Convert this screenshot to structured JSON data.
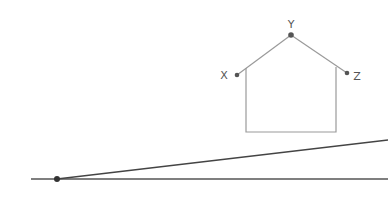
{
  "diagram": {
    "colors": {
      "house_stroke": "#9a9a9a",
      "line_stroke": "#555555",
      "point_fill": "#555555",
      "label_fill": "#555555",
      "background": "#ffffff"
    },
    "points": [
      {
        "id": "X",
        "label": "X",
        "x": 237,
        "y": 75
      },
      {
        "id": "Y",
        "label": "Y",
        "x": 291,
        "y": 35
      },
      {
        "id": "Z",
        "label": "Z",
        "x": 347,
        "y": 73
      },
      {
        "id": "origin",
        "label": "",
        "x": 57,
        "y": 179
      }
    ],
    "house": {
      "left_wall_x": 246,
      "right_wall_x": 336,
      "bottom_y": 132,
      "left_eave_y": 67,
      "right_eave_y": 68
    },
    "lines": [
      {
        "id": "baseline",
        "x1": 31,
        "y1": 179,
        "x2": 388,
        "y2": 179
      },
      {
        "id": "slanted",
        "x1": 57,
        "y1": 179,
        "x2": 388,
        "y2": 140
      }
    ]
  }
}
